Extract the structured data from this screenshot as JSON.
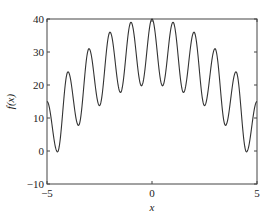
{
  "chart_data": {
    "type": "line",
    "title": "",
    "xlabel": "x",
    "ylabel": "f(x)",
    "xlim": [
      -5,
      5
    ],
    "ylim": [
      -10,
      40
    ],
    "grid": false,
    "legend": null,
    "xticks": [
      -5,
      0,
      5
    ],
    "xtick_labels": [
      "−5",
      "0",
      "5"
    ],
    "yticks": [
      -10,
      0,
      10,
      20,
      30,
      40
    ],
    "ytick_labels": [
      "−10",
      "0",
      "10",
      "20",
      "30",
      "40"
    ],
    "line_color": "#333333",
    "function_description": "f(x) = 30 - x^2 + 10 cos(2*pi*x)",
    "series": [
      {
        "name": "f(x)",
        "x": [
          -5,
          -4.5,
          -4,
          -3.5,
          -3,
          -2.5,
          -2,
          -1.5,
          -1,
          -0.5,
          0,
          0.5,
          1,
          1.5,
          2,
          2.5,
          3,
          3.5,
          4,
          4.5,
          5
        ],
        "values": [
          15,
          -0.25,
          24,
          7.75,
          31,
          13.75,
          36,
          17.75,
          39,
          19.75,
          40,
          19.75,
          39,
          17.75,
          36,
          13.75,
          31,
          7.75,
          24,
          -0.25,
          15
        ]
      }
    ],
    "peaks": [
      {
        "x": -5,
        "y": 15
      },
      {
        "x": -4,
        "y": 24
      },
      {
        "x": -3,
        "y": 31
      },
      {
        "x": -2,
        "y": 36
      },
      {
        "x": -1,
        "y": 39
      },
      {
        "x": 0,
        "y": 40
      },
      {
        "x": 1,
        "y": 39
      },
      {
        "x": 2,
        "y": 36
      },
      {
        "x": 3,
        "y": 31
      },
      {
        "x": 4,
        "y": 24
      },
      {
        "x": 5,
        "y": 15
      }
    ],
    "troughs": [
      {
        "x": -4.5,
        "y": -0.25
      },
      {
        "x": -3.5,
        "y": 7.75
      },
      {
        "x": -2.5,
        "y": 13.75
      },
      {
        "x": -1.5,
        "y": 17.75
      },
      {
        "x": -0.5,
        "y": 19.75
      },
      {
        "x": 0.5,
        "y": 19.75
      },
      {
        "x": 1.5,
        "y": 17.75
      },
      {
        "x": 2.5,
        "y": 13.75
      },
      {
        "x": 3.5,
        "y": 7.75
      },
      {
        "x": 4.5,
        "y": -0.25
      }
    ]
  },
  "layout": {
    "plot_left": 47,
    "plot_top": 19,
    "plot_right": 257,
    "plot_bottom": 184
  }
}
